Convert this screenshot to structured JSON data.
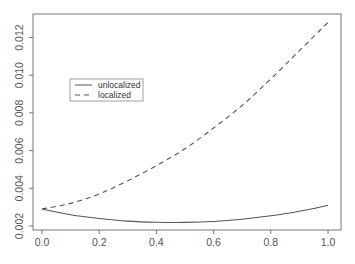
{
  "chart_data": {
    "type": "line",
    "title": "",
    "xlabel": "",
    "ylabel": "",
    "xlim": [
      -0.03,
      1.045
    ],
    "ylim": [
      0.0019,
      0.0133
    ],
    "grid": false,
    "legend_position": "upper-left (inset)",
    "x_ticks": [
      "0.0",
      "0.2",
      "0.4",
      "0.6",
      "0.8",
      "1.0"
    ],
    "y_ticks": [
      "0.002",
      "0.004",
      "0.006",
      "0.008",
      "0.010",
      "0.012"
    ],
    "x": [
      0.0,
      0.1,
      0.2,
      0.3,
      0.4,
      0.5,
      0.6,
      0.7,
      0.8,
      0.9,
      1.0
    ],
    "series": [
      {
        "name": "unlocalized",
        "style": "solid",
        "values": [
          0.0029,
          0.0026,
          0.0024,
          0.00226,
          0.0022,
          0.00219,
          0.00224,
          0.00236,
          0.00254,
          0.00278,
          0.0031
        ]
      },
      {
        "name": "localized",
        "style": "dashed",
        "values": [
          0.0029,
          0.0032,
          0.0037,
          0.0044,
          0.0052,
          0.0061,
          0.0072,
          0.0084,
          0.0098,
          0.0113,
          0.0128
        ]
      }
    ]
  },
  "legend": {
    "items": [
      {
        "label": "unlocalized",
        "style": "solid"
      },
      {
        "label": "localized",
        "style": "dashed"
      }
    ]
  },
  "colors": {
    "axis": "#777777",
    "line": "#555555",
    "text": "#555555"
  }
}
